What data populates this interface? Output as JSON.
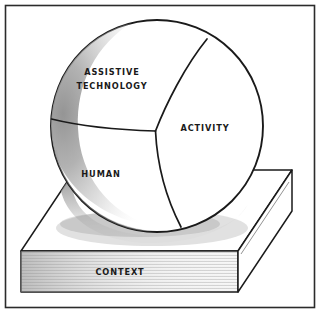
{
  "figure": {
    "border_color": "#2b2b2b",
    "background_color": "#ffffff",
    "ink_color": "#1a1a1a",
    "shade_color": "#9a9a9a"
  },
  "sphere": {
    "name": "three-segment-sphere",
    "center_x": 157,
    "center_y": 126,
    "radius": 106,
    "segments": [
      {
        "id": "assistive-technology",
        "label_line1": "ASSISTIVE",
        "label_line2": "TECHNOLOGY",
        "label_x": 112,
        "label_y1": 75,
        "label_y2": 89
      },
      {
        "id": "activity",
        "label": "ACTIVITY",
        "label_x": 205,
        "label_y": 131
      },
      {
        "id": "human",
        "label": "HUMAN",
        "label_x": 101,
        "label_y": 177
      }
    ]
  },
  "platform": {
    "name": "context-platform",
    "label": "CONTEXT",
    "label_x": 120,
    "label_y": 275
  }
}
